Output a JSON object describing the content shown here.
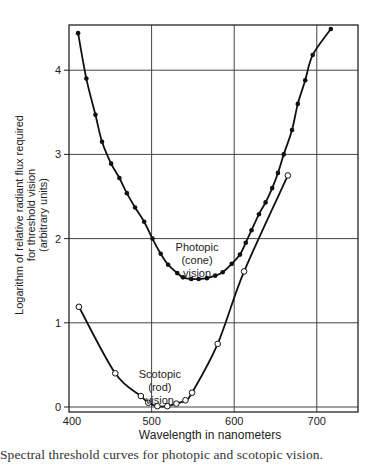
{
  "caption": "Spectral threshold curves for photopic and scotopic vision.",
  "chart_data": {
    "type": "line",
    "title": "",
    "xlabel": "Wavelength in nanometers",
    "ylabel_lines": [
      "Logarithm of relative radiant flux required",
      "for threshold vision",
      "(arbitrary units)"
    ],
    "ylabel": "Logarithm of relative radiant flux required for threshold vision (arbitrary units)",
    "xlim": [
      400,
      750
    ],
    "ylim": [
      0,
      4.5
    ],
    "xticks": [
      400,
      500,
      600,
      700
    ],
    "yticks": [
      0,
      1,
      2,
      3,
      4
    ],
    "grid": true,
    "legend": "none (inline annotations)",
    "annotations": [
      {
        "lines": [
          "Photopic",
          "(cone)",
          "vision"
        ],
        "x": 555,
        "y": 1.85
      },
      {
        "lines": [
          "Scotopic",
          "(rod)",
          "vision"
        ],
        "x": 510,
        "y": 0.35
      }
    ],
    "series": [
      {
        "name": "Photopic (cone) vision",
        "marker": "filled-circle",
        "x": [
          411,
          421,
          432,
          440,
          451,
          461,
          470,
          480,
          491,
          501,
          511,
          520,
          531,
          538,
          548,
          557,
          567,
          577,
          586,
          597,
          607,
          614,
          621,
          630,
          638,
          646,
          653,
          660,
          670,
          677,
          686,
          695,
          717
        ],
        "y": [
          4.44,
          3.9,
          3.47,
          3.15,
          2.89,
          2.72,
          2.54,
          2.37,
          2.2,
          2.0,
          1.82,
          1.69,
          1.59,
          1.54,
          1.52,
          1.52,
          1.53,
          1.56,
          1.6,
          1.7,
          1.81,
          1.95,
          2.1,
          2.29,
          2.43,
          2.6,
          2.78,
          3.0,
          3.29,
          3.6,
          3.88,
          4.18,
          4.49
        ]
      },
      {
        "name": "Scotopic (rod) vision",
        "marker": "open-circle",
        "x": [
          412,
          456,
          487,
          496,
          507,
          519,
          530,
          541,
          549,
          580,
          612,
          665
        ],
        "y": [
          1.19,
          0.4,
          0.13,
          0.05,
          0.01,
          0.01,
          0.04,
          0.08,
          0.17,
          0.75,
          1.61,
          2.75
        ]
      }
    ]
  }
}
